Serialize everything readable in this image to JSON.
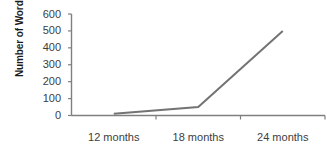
{
  "chart_data": {
    "type": "line",
    "title": "",
    "subtitle": "",
    "xlabel": "",
    "ylabel": "Number of Words",
    "categories": [
      "12 months",
      "18 months",
      "24 months"
    ],
    "values": [
      10,
      50,
      500
    ],
    "series": [
      {
        "name": "Number of Words",
        "values": [
          10,
          50,
          500
        ]
      }
    ],
    "ylim": [
      0,
      600
    ],
    "y_ticks": [
      0,
      100,
      200,
      300,
      400,
      500,
      600
    ],
    "y_tick_labels": [
      "0",
      "100",
      "200",
      "300",
      "400",
      "500",
      "600"
    ],
    "grid": false,
    "legend": false,
    "legend_position": "none",
    "annotations": []
  },
  "style": {
    "line_color": "#737373",
    "axis_color": "#7f7f7f",
    "tick_label_color": "#3d3d3d",
    "axis_title_color": "#1a1a1a",
    "background_color": "#ffffff"
  }
}
